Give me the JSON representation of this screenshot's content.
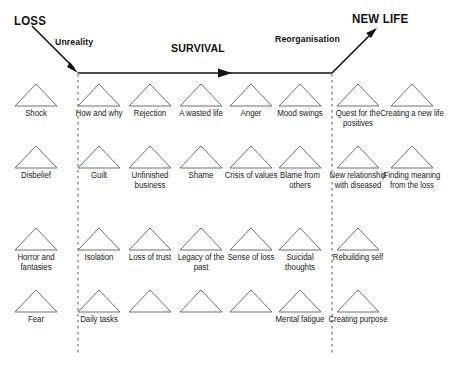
{
  "diagram": {
    "title_left": "LOSS",
    "title_right": "NEW LIFE",
    "phase_unreality": "Unreality",
    "phase_survival": "SURVIVAL",
    "phase_reorganisation": "Reorganisation",
    "line_color": "#111111",
    "triangle_color": "#6e6e6e",
    "divider_color": "#555555"
  },
  "columns": [
    {
      "x": 11,
      "band": "unreality"
    },
    {
      "x": 74,
      "band": "survival"
    },
    {
      "x": 125,
      "band": "survival"
    },
    {
      "x": 176,
      "band": "survival"
    },
    {
      "x": 226,
      "band": "survival"
    },
    {
      "x": 275,
      "band": "survival"
    },
    {
      "x": 333,
      "band": "reorganisation"
    },
    {
      "x": 387,
      "band": "reorganisation"
    }
  ],
  "rows": [
    {
      "y": 82
    },
    {
      "y": 144
    },
    {
      "y": 226
    },
    {
      "y": 288
    }
  ],
  "cells": [
    {
      "row": 0,
      "col": 0,
      "label": "Shock"
    },
    {
      "row": 0,
      "col": 1,
      "label": "How and why"
    },
    {
      "row": 0,
      "col": 2,
      "label": "Rejection"
    },
    {
      "row": 0,
      "col": 3,
      "label": "A wasted life"
    },
    {
      "row": 0,
      "col": 4,
      "label": "Anger"
    },
    {
      "row": 0,
      "col": 5,
      "label": "Mood swings"
    },
    {
      "row": 0,
      "col": 6,
      "label": "Quest for the positives"
    },
    {
      "row": 0,
      "col": 7,
      "label": "Creating a new life"
    },
    {
      "row": 1,
      "col": 0,
      "label": "Disbelief"
    },
    {
      "row": 1,
      "col": 1,
      "label": "Guilt"
    },
    {
      "row": 1,
      "col": 2,
      "label": "Unfinished business"
    },
    {
      "row": 1,
      "col": 3,
      "label": "Shame"
    },
    {
      "row": 1,
      "col": 4,
      "label": "Crisis of values"
    },
    {
      "row": 1,
      "col": 5,
      "label": "Blame from others"
    },
    {
      "row": 1,
      "col": 6,
      "label": "New relationship with diseased"
    },
    {
      "row": 1,
      "col": 7,
      "label": "Finding meaning from the loss"
    },
    {
      "row": 2,
      "col": 0,
      "label": "Horror and fantasies"
    },
    {
      "row": 2,
      "col": 1,
      "label": "Isolation"
    },
    {
      "row": 2,
      "col": 2,
      "label": "Loss of trust"
    },
    {
      "row": 2,
      "col": 3,
      "label": "Legacy of the past"
    },
    {
      "row": 2,
      "col": 4,
      "label": "Sense of loss"
    },
    {
      "row": 2,
      "col": 5,
      "label": "Suicidal thoughts"
    },
    {
      "row": 2,
      "col": 6,
      "label": "Rebuilding self"
    },
    {
      "row": 3,
      "col": 0,
      "label": "Fear"
    },
    {
      "row": 3,
      "col": 1,
      "label": "Daily tasks"
    },
    {
      "row": 3,
      "col": 2,
      "label": ""
    },
    {
      "row": 3,
      "col": 3,
      "label": ""
    },
    {
      "row": 3,
      "col": 4,
      "label": ""
    },
    {
      "row": 3,
      "col": 5,
      "label": "Mental fatigue"
    },
    {
      "row": 3,
      "col": 6,
      "label": "Creating purpose"
    }
  ],
  "dividers": [
    {
      "x": 78,
      "y1": 74,
      "y2": 356
    },
    {
      "x": 332,
      "y1": 74,
      "y2": 356
    }
  ]
}
